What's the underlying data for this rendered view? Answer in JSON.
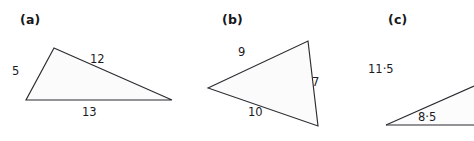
{
  "figure": {
    "background_color": "#ffffff",
    "line_color": "#2b2b30",
    "fill_color": "#fbfbfb",
    "text_color": "#1b1b1f"
  },
  "panels": [
    {
      "key": "a",
      "label": "(a)",
      "shape": "triangle",
      "cropped": false,
      "sides": [
        {
          "name": "left",
          "label": "5"
        },
        {
          "name": "hypotenuse",
          "label": "12"
        },
        {
          "name": "base",
          "label": "13"
        }
      ]
    },
    {
      "key": "b",
      "label": "(b)",
      "shape": "triangle",
      "cropped": false,
      "sides": [
        {
          "name": "upper-left",
          "label": "9"
        },
        {
          "name": "right",
          "label": "7"
        },
        {
          "name": "lower-left",
          "label": "10"
        }
      ]
    },
    {
      "key": "c",
      "label": "(c)",
      "shape": "triangle",
      "cropped": true,
      "sides": [
        {
          "name": "hypotenuse",
          "label": "11·5"
        },
        {
          "name": "base",
          "label": "8·5"
        }
      ]
    }
  ]
}
